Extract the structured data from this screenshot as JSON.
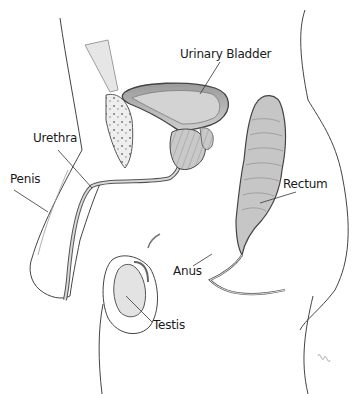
{
  "diagram": {
    "labels": {
      "urinary_bladder": "Urinary Bladder",
      "urethra": "Urethra",
      "penis": "Penis",
      "rectum": "Rectum",
      "anus": "Anus",
      "testis": "Testis"
    },
    "colors": {
      "outline": "#3a3a3a",
      "organ_fill": "#b8b8b8",
      "organ_dark": "#7a7a7a",
      "shading": "#d6d6d6",
      "label_text": "#1a1a1a"
    }
  }
}
